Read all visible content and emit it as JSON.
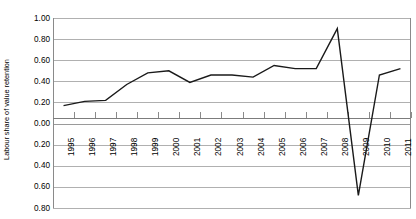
{
  "chart_data": {
    "type": "line",
    "title": "",
    "xlabel": "",
    "ylabel": "Labour share of value retention",
    "categories": [
      "1995",
      "1996",
      "1997",
      "1998",
      "1999",
      "2000",
      "2001",
      "2002",
      "2003",
      "2004",
      "2005",
      "2006",
      "2007",
      "2008",
      "2009",
      "2010",
      "2011"
    ],
    "x": [
      1995,
      1996,
      1997,
      1998,
      1999,
      2000,
      2001,
      2002,
      2003,
      2004,
      2005,
      2006,
      2007,
      2008,
      2009,
      2010,
      2011
    ],
    "series": [
      {
        "name": "Labour share of value retention",
        "values": [
          0.17,
          0.21,
          0.22,
          0.37,
          0.48,
          0.5,
          0.39,
          0.46,
          0.46,
          0.44,
          0.55,
          0.52,
          0.52,
          0.9,
          -0.68,
          0.46,
          0.52
        ]
      }
    ],
    "ylim": [
      -0.8,
      1.0
    ],
    "ytick_labels": [
      "1.00",
      "0.80",
      "0.60",
      "0.40",
      "0.20",
      "0.00",
      "0.20",
      "0.40",
      "0.60",
      "0.80"
    ],
    "yticks": [
      1.0,
      0.8,
      0.6,
      0.4,
      0.2,
      0.0,
      -0.2,
      -0.4,
      -0.6,
      -0.8
    ],
    "grid": true,
    "legend": "none",
    "line_color": "#1a1a1a",
    "grid_color": "#b0b0b0",
    "axis_color": "#8a8a8a",
    "background_color": "#ffffff"
  }
}
